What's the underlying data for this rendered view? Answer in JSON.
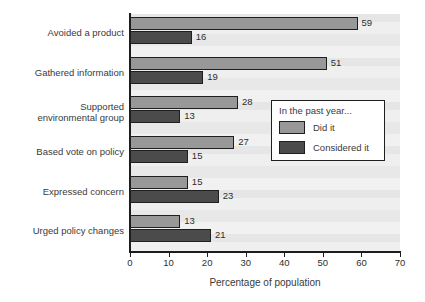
{
  "chart_data": {
    "type": "bar",
    "orientation": "horizontal",
    "title": "",
    "xlabel": "Percentage of population",
    "ylabel": "",
    "xlim": [
      0,
      70
    ],
    "xticks": [
      0,
      10,
      20,
      30,
      40,
      50,
      60,
      70
    ],
    "grid": false,
    "legend_position": "middle-right-inside",
    "categories": [
      "Avoided a product",
      "Gathered information",
      "Supported\nenvironmental group",
      "Based vote on policy",
      "Expressed concern",
      "Urged policy changes"
    ],
    "series": [
      {
        "name": "Did it",
        "color": "#989898",
        "values": [
          59,
          51,
          28,
          27,
          15,
          13
        ]
      },
      {
        "name": "Considered it",
        "color": "#4b4b4b",
        "values": [
          16,
          19,
          13,
          15,
          23,
          21
        ]
      }
    ]
  },
  "legend": {
    "title": "In the past year...",
    "entries": [
      {
        "label": "Did it",
        "color": "#989898"
      },
      {
        "label": "Considered it",
        "color": "#4b4b4b"
      }
    ]
  },
  "colors": {
    "plot_background": "#eaeaea",
    "axis": "#1d1d1d",
    "did_it": "#989898",
    "considered_it": "#4b4b4b",
    "text": "#2e2e2e"
  }
}
